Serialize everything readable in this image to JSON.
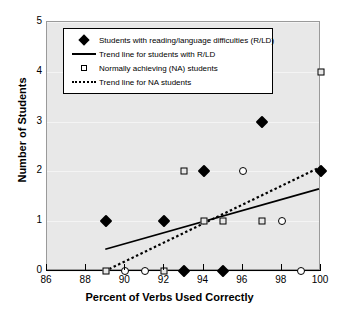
{
  "chart_data": {
    "type": "scatter",
    "title": "",
    "xlabel": "Percent of Verbs Used Correctly",
    "ylabel": "Number of Students",
    "xlim": [
      86,
      100
    ],
    "ylim": [
      0,
      5
    ],
    "xticks": [
      86,
      88,
      90,
      92,
      94,
      96,
      98,
      100
    ],
    "yticks": [
      0,
      1,
      2,
      3,
      4,
      5
    ],
    "grid": true,
    "legend_position": "top-left-inside",
    "plot_background": "#e8e8e8",
    "series": [
      {
        "name": "Students with reading/language difficulties  (R/LD)",
        "marker": "filled-diamond",
        "color": "#000000",
        "points": [
          {
            "x": 89,
            "y": 1
          },
          {
            "x": 92,
            "y": 1
          },
          {
            "x": 93,
            "y": 0
          },
          {
            "x": 94,
            "y": 2
          },
          {
            "x": 95,
            "y": 0
          },
          {
            "x": 97,
            "y": 3
          },
          {
            "x": 100,
            "y": 2
          }
        ]
      },
      {
        "name": "Normally achieving (NA) students",
        "marker": "open-square",
        "color": "#000000",
        "points": [
          {
            "x": 89,
            "y": 0
          },
          {
            "x": 92,
            "y": 0
          },
          {
            "x": 93,
            "y": 2
          },
          {
            "x": 94,
            "y": 1
          },
          {
            "x": 95,
            "y": 1
          },
          {
            "x": 97,
            "y": 1
          },
          {
            "x": 100,
            "y": 4
          }
        ]
      },
      {
        "name": "Overlapping observations",
        "marker": "open-circle",
        "color": "#000000",
        "points": [
          {
            "x": 90,
            "y": 0
          },
          {
            "x": 91,
            "y": 0
          },
          {
            "x": 96,
            "y": 2
          },
          {
            "x": 98,
            "y": 1
          },
          {
            "x": 99,
            "y": 0
          }
        ]
      }
    ],
    "trend_lines": [
      {
        "name": "Trend line for students with R/LD",
        "style": "solid",
        "color": "#000000",
        "x0": 89.0,
        "y0": 0.4,
        "x1": 100.0,
        "y1": 1.62
      },
      {
        "name": "Trend line for NA students",
        "style": "dotted",
        "color": "#000000",
        "x0": 89.2,
        "y0": 0.0,
        "x1": 100.0,
        "y1": 2.05
      }
    ]
  },
  "legend": {
    "items": [
      {
        "key": "filled-diamond-key-icon",
        "label": "Students with reading/language difficulties  (R/LD)"
      },
      {
        "key": "solid-line-key-icon",
        "label": "Trend line for students with R/LD"
      },
      {
        "key": "open-square-key-icon",
        "label": "Normally achieving (NA) students"
      },
      {
        "key": "dotted-line-key-icon",
        "label": "Trend line for NA students"
      }
    ]
  }
}
